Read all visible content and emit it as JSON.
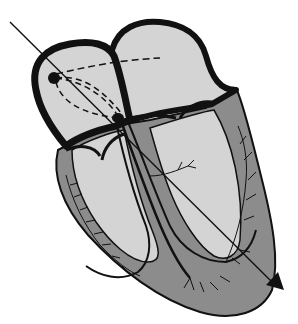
{
  "diagram": {
    "colors": {
      "background": "#ffffff",
      "chamber_fill": "#d4d4d4",
      "myocardium_fill": "#8c8c8c",
      "outline": "#111111",
      "conduction": "#111111"
    },
    "structures": [
      {
        "name": "right-atrium"
      },
      {
        "name": "left-atrium"
      },
      {
        "name": "right-ventricle"
      },
      {
        "name": "left-ventricle"
      },
      {
        "name": "sinoatrial-node"
      },
      {
        "name": "atrioventricular-node"
      },
      {
        "name": "bundle-of-his"
      },
      {
        "name": "bundle-branches"
      },
      {
        "name": "purkinje-fibers"
      },
      {
        "name": "interatrial-pathway-dashed"
      },
      {
        "name": "internodal-pathways-dashed"
      },
      {
        "name": "electrical-axis-arrow"
      }
    ]
  }
}
